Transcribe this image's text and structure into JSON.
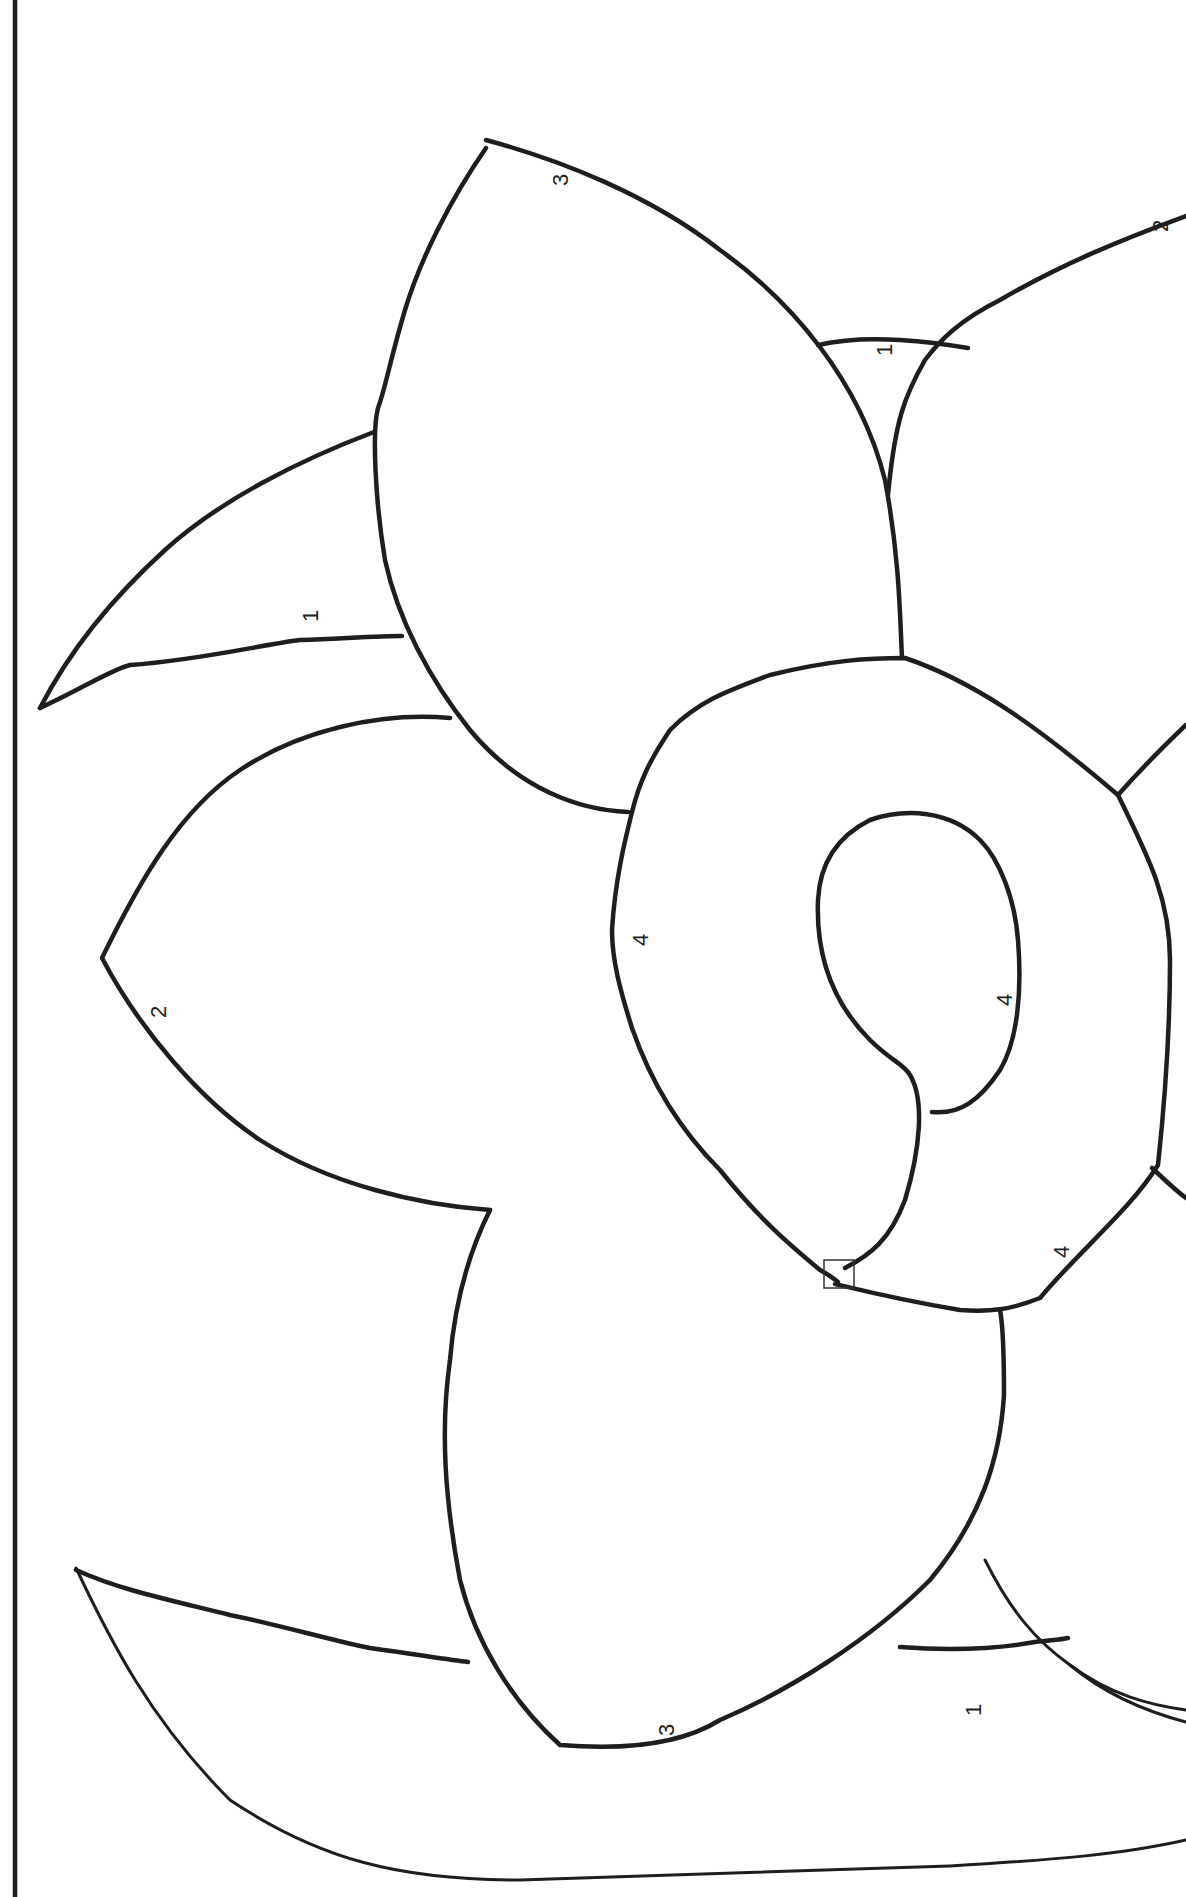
{
  "page": {
    "type": "color-by-number coloring page",
    "background_color": "#ffffff",
    "line_color": "#1e1e1e"
  },
  "labels": [
    {
      "id": "top-petal-3",
      "text": "3",
      "x": 568,
      "y": 186
    },
    {
      "id": "top-right-2",
      "text": "2",
      "x": 1168,
      "y": 232
    },
    {
      "id": "top-middle-leaf-1",
      "text": "1",
      "x": 892,
      "y": 356
    },
    {
      "id": "left-leaf-1",
      "text": "1",
      "x": 318,
      "y": 622
    },
    {
      "id": "left-petal-2",
      "text": "2",
      "x": 158,
      "y": 1010
    },
    {
      "id": "trumpet-outer-4",
      "text": "4",
      "x": 640,
      "y": 938
    },
    {
      "id": "trumpet-inner-4",
      "text": "4",
      "x": 1004,
      "y": 998
    },
    {
      "id": "trumpet-rim-4",
      "text": "4",
      "x": 1061,
      "y": 1250
    },
    {
      "id": "bottom-leaf-1",
      "text": "1",
      "x": 973,
      "y": 1708
    },
    {
      "id": "bottom-petal-3",
      "text": "3",
      "x": 666,
      "y": 1728
    }
  ]
}
